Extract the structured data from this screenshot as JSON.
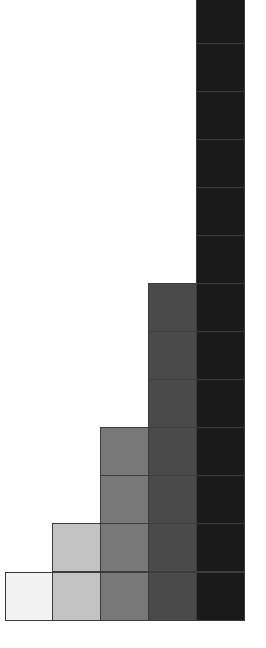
{
  "figure": {
    "background_color": "#ffffff",
    "cell_border_color": "#3b3b3b"
  },
  "chart_data": {
    "type": "bar",
    "title": "",
    "subtitle": "",
    "xlabel": "",
    "ylabel": "",
    "categories": [
      "1",
      "2",
      "3",
      "4",
      "5"
    ],
    "values": [
      1,
      2,
      4,
      7,
      13
    ],
    "series": [
      {
        "name": "count",
        "values": [
          1,
          2,
          4,
          7,
          13
        ]
      }
    ],
    "unit": "square",
    "unit_value": 1,
    "grid": false,
    "legend": false,
    "legend_position": "none",
    "axis_visible": false,
    "tick_labels_visible": false,
    "annotations": [],
    "xlim": [
      0,
      5
    ],
    "ylim": [
      0,
      13
    ],
    "bar_colors": [
      "#f2f2f2",
      "#c3c3c3",
      "#787878",
      "#4a4a4a",
      "#1a1a1a"
    ],
    "clipped_columns": [
      "5"
    ],
    "bars": [
      {
        "index": 0,
        "label": "1",
        "value": 1,
        "color": "#f2f2f2",
        "clipped": false
      },
      {
        "index": 1,
        "label": "2",
        "value": 2,
        "color": "#c3c3c3",
        "clipped": false
      },
      {
        "index": 2,
        "label": "3",
        "value": 4,
        "color": "#787878",
        "clipped": false
      },
      {
        "index": 3,
        "label": "4",
        "value": 7,
        "color": "#4a4a4a",
        "clipped": false
      },
      {
        "index": 4,
        "label": "5",
        "value": 13,
        "color": "#1a1a1a",
        "clipped": true
      }
    ],
    "geometry": {
      "cell_width": 49,
      "cell_height": 49,
      "left_margin": 5,
      "baseline_y": 621
    }
  }
}
